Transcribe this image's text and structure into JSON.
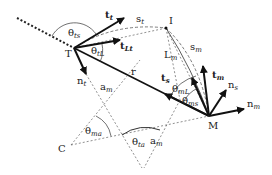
{
  "diagram": {
    "points": {
      "T": {
        "label": "T",
        "x": 74,
        "y": 48
      },
      "I": {
        "label": "I",
        "x": 166,
        "y": 28
      },
      "M": {
        "label": "M",
        "x": 209,
        "y": 116
      },
      "C": {
        "label": "C",
        "x": 71,
        "y": 145
      }
    },
    "labels": {
      "t_t": {
        "base": "t",
        "sub": "t"
      },
      "t_Lt": {
        "base": "t",
        "sub": "Lt"
      },
      "theta_ts": {
        "base": "θ",
        "sub": "ts"
      },
      "theta_tL": {
        "base": "θ",
        "sub": "tL"
      },
      "n_t": {
        "base": "n",
        "sub": "t"
      },
      "s_t": {
        "base": "s",
        "sub": "t"
      },
      "s_m": {
        "base": "s",
        "sub": "m"
      },
      "L_m": {
        "base": "L",
        "sub": "m"
      },
      "r": {
        "base": "r",
        "sub": ""
      },
      "a_m_upper": {
        "base": "a",
        "sub": "m"
      },
      "a_m_lower": {
        "base": "a",
        "sub": "m"
      },
      "t_s": {
        "base": "t",
        "sub": "s"
      },
      "t_m": {
        "base": "t",
        "sub": "m"
      },
      "n_s": {
        "base": "n",
        "sub": "s"
      },
      "n_m": {
        "base": "n",
        "sub": "m"
      },
      "theta_mL": {
        "base": "θ",
        "sub": "mL"
      },
      "theta_ms": {
        "base": "θ",
        "sub": "ms"
      },
      "theta_ma": {
        "base": "θ",
        "sub": "ma"
      },
      "theta_ta": {
        "base": "θ",
        "sub": "ta"
      }
    }
  }
}
